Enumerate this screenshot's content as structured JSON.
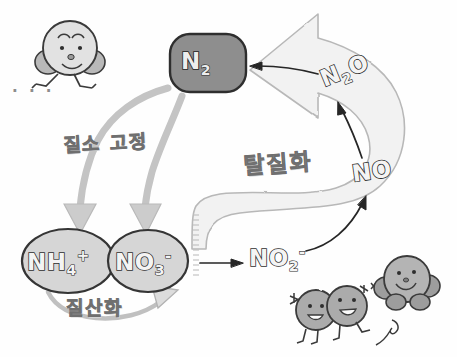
{
  "diagram": {
    "background_color": "#fefefe"
  },
  "nodes": [
    {
      "id": "n2",
      "formula_main": "N",
      "formula_sub": "2",
      "formula_sup": "",
      "shape": "rounded-rect",
      "fill": "#8e8e8e"
    },
    {
      "id": "nh4",
      "formula_main": "NH",
      "formula_sub": "4",
      "formula_sup": "+",
      "shape": "ellipse",
      "fill": "#d6d6d6"
    },
    {
      "id": "no3",
      "formula_main": "NO",
      "formula_sub": "3",
      "formula_sup": "-",
      "shape": "ellipse",
      "fill": "#d6d6d6"
    },
    {
      "id": "no2",
      "formula_main": "NO",
      "formula_sub": "2",
      "formula_sup": "-",
      "shape": "none",
      "fill": "none"
    },
    {
      "id": "no",
      "formula_main": "NO",
      "formula_sub": "",
      "formula_sup": "",
      "shape": "none",
      "fill": "none"
    },
    {
      "id": "n2o",
      "formula_main": "N",
      "formula_sub": "2",
      "formula_sup": "",
      "formula_tail": "O",
      "shape": "none",
      "fill": "none"
    }
  ],
  "process_labels": [
    {
      "id": "fixation",
      "text": "질소 고정",
      "meaning": "nitrogen fixation"
    },
    {
      "id": "nitrification",
      "text": "질산화",
      "meaning": "nitrification"
    },
    {
      "id": "denitrification",
      "text": "탈질화",
      "meaning": "denitrification"
    }
  ],
  "decorations": {
    "ellipsis": "· · ·",
    "characters": [
      {
        "id": "runner",
        "description": "running molecule mascot"
      },
      {
        "id": "pair",
        "description": "two-lobed molecule mascot"
      },
      {
        "id": "round",
        "description": "round molecule mascot"
      }
    ]
  },
  "colors": {
    "dark_node": "#8e8e8e",
    "light_node": "#d6d6d6",
    "arrow_fill": "#f0f0f0",
    "arrow_stroke": "#b5b5b5",
    "ink": "#2e2e2e",
    "label_gray": "#8a8a8a"
  }
}
